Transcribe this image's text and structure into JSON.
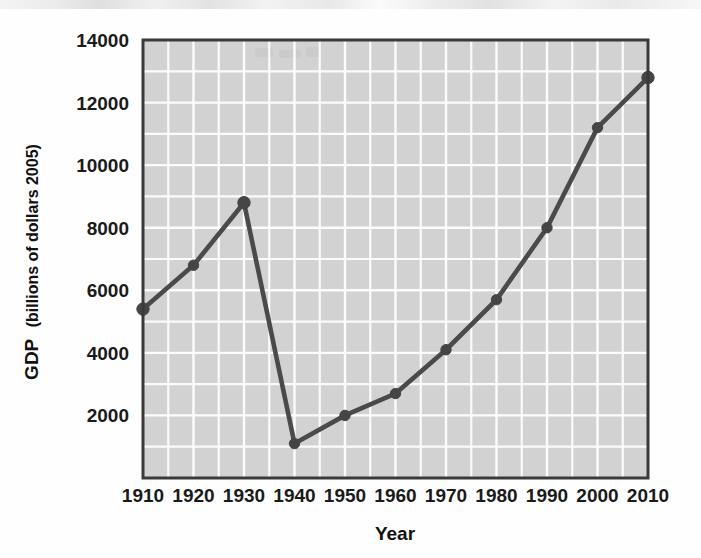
{
  "chart_data": {
    "type": "line",
    "title": "",
    "xlabel": "Year",
    "ylabel": "GDP (billions of dollars 2005)",
    "ylabel_main": "GDP",
    "ylabel_paren": "(billions of dollars 2005)",
    "x": [
      1910,
      1920,
      1930,
      1940,
      1950,
      1960,
      1970,
      1980,
      1990,
      2000,
      2010
    ],
    "xtick_labels": [
      "1910",
      "1920",
      "1930",
      "1940",
      "1950",
      "1960",
      "1970",
      "1980",
      "1990",
      "2000",
      "2010"
    ],
    "values": [
      5400,
      6800,
      8800,
      1100,
      2000,
      2700,
      4100,
      5700,
      8000,
      11200,
      12800
    ],
    "ytick_labels": [
      "2000",
      "4000",
      "6000",
      "8000",
      "10000",
      "12000",
      "14000"
    ],
    "yticks": [
      2000,
      4000,
      6000,
      8000,
      10000,
      12000,
      14000
    ],
    "xlim": [
      1910,
      2010
    ],
    "ylim": [
      0,
      14000
    ],
    "grid": true,
    "grid_y_step": 1000,
    "grid_x_step": 5,
    "legend": "none",
    "series_name": "GDP",
    "marker": "circle",
    "colors": {
      "line": "#4a4a4a",
      "marker": "#454545",
      "plot_background": "#d2d2d2",
      "gridline": "#fcfcfc",
      "frame": "#3a3a3a",
      "text": "#111111",
      "page_background": "#ffffff"
    }
  }
}
